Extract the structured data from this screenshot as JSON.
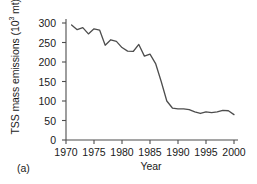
{
  "figure": {
    "panel_label": "(a)",
    "xlabel": "Year",
    "ylabel_prefix": "TSS mass emissions (10",
    "ylabel_exponent": "3",
    "ylabel_suffix": " mt)",
    "line_color": "#4d4d4d",
    "axis_color": "#4d4d4d",
    "text_color": "#1a1a1a"
  },
  "chart_data": {
    "type": "line",
    "title": "",
    "subtitle": "",
    "xlabel": "Year",
    "ylabel": "TSS mass emissions (10^3 mt)",
    "xlim": [
      1970,
      2000
    ],
    "ylim": [
      0,
      300
    ],
    "xticks": [
      1970,
      1975,
      1980,
      1985,
      1990,
      1995,
      2000
    ],
    "yticks": [
      0,
      50,
      100,
      150,
      200,
      250,
      300
    ],
    "xtick_labels": [
      "1970",
      "1975",
      "1980",
      "1985",
      "1990",
      "1995",
      "2000"
    ],
    "ytick_labels": [
      "0",
      "50",
      "100",
      "150",
      "200",
      "250",
      "300"
    ],
    "grid": false,
    "legend": null,
    "annotations": [
      "(a)"
    ],
    "series": [
      {
        "name": "TSS mass emissions",
        "x": [
          1971,
          1972,
          1973,
          1974,
          1975,
          1976,
          1977,
          1978,
          1979,
          1980,
          1981,
          1982,
          1983,
          1984,
          1985,
          1986,
          1987,
          1988,
          1989,
          1990,
          1991,
          1992,
          1993,
          1994,
          1995,
          1996,
          1997,
          1998,
          1999,
          2000
        ],
        "y": [
          295,
          283,
          288,
          272,
          285,
          282,
          243,
          257,
          253,
          237,
          228,
          227,
          245,
          215,
          220,
          196,
          150,
          100,
          82,
          80,
          80,
          78,
          72,
          68,
          72,
          70,
          72,
          76,
          75,
          65
        ]
      }
    ]
  }
}
